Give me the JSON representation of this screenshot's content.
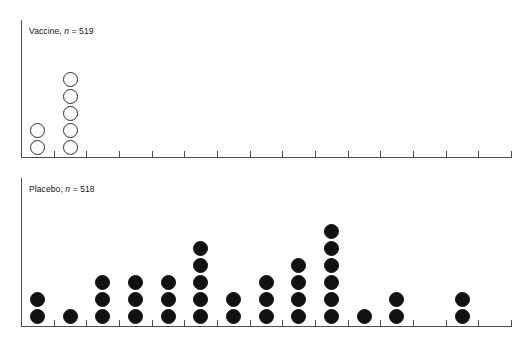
{
  "figure": {
    "width": 529,
    "height": 340,
    "background": "#ffffff",
    "ink_color": "#4d4d4d",
    "dot_fill_color": "#111111",
    "dot_open_color": "#ffffff",
    "dot_outline_color": "#2b2b2b"
  },
  "chart_data": {
    "type": "dot-plot",
    "title": "",
    "subtitle": "",
    "xlabel": "",
    "ylabel": "",
    "grid": false,
    "legend_position": "none",
    "axis_tick_labels": [],
    "bin_count": 15,
    "panels": [
      {
        "id": "vaccine",
        "label_prefix": "Vaccine, ",
        "label_italic": "n",
        "label_suffix": " = 519",
        "label_full": "Vaccine, n = 519",
        "n": 519,
        "marker": "open-circle",
        "max_stack": 5,
        "ylim": [
          0,
          8
        ],
        "values": [
          2,
          5,
          0,
          0,
          0,
          0,
          0,
          0,
          0,
          0,
          0,
          0,
          0,
          0,
          0
        ]
      },
      {
        "id": "placebo",
        "label_prefix": "Placebo, ",
        "label_italic": "n",
        "label_suffix": " = 518",
        "label_full": "Placebo, n = 518",
        "n": 518,
        "marker": "filled-circle",
        "max_stack": 6,
        "ylim": [
          0,
          8
        ],
        "values": [
          2,
          1,
          3,
          3,
          3,
          5,
          2,
          3,
          4,
          6,
          1,
          2,
          0,
          2,
          0
        ]
      }
    ]
  }
}
